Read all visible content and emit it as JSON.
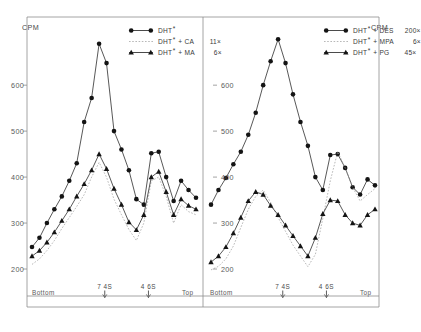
{
  "figure": {
    "axis_unit_label": "CPM",
    "x_axis": {
      "left_label": "Bottom",
      "right_label": "Top",
      "markers": [
        {
          "label": "7 4S",
          "position_fraction": 0.445
        },
        {
          "label": "4 6S",
          "position_fraction": 0.705
        }
      ]
    },
    "y_axis": {
      "ticks": [
        600,
        500,
        400,
        300,
        200
      ],
      "min": 150,
      "max": 720
    }
  },
  "chart_data": [
    {
      "type": "line",
      "title": "Left panel",
      "panel": "left",
      "xlabel": "Sedimentation (Bottom to Top)",
      "ylabel": "CPM",
      "ylim": [
        150,
        720
      ],
      "grid": false,
      "legend_position": "top-right",
      "x_markers": [
        "7 4S",
        "4 6S"
      ],
      "x_axis_endpoints": [
        "Bottom",
        "Top"
      ],
      "series": [
        {
          "name": "DHT*",
          "label_base": "DHT",
          "label_sup": "*",
          "label_competitor": "",
          "label_factor": "",
          "marker": "circle",
          "line": "solid",
          "values": [
            248,
            268,
            300,
            330,
            358,
            392,
            430,
            520,
            572,
            690,
            648,
            500,
            460,
            415,
            352,
            340,
            452,
            455,
            400,
            348,
            392,
            372,
            355
          ]
        },
        {
          "name": "DHT* + CA 11x",
          "label_base": "DHT",
          "label_sup": "*",
          "label_competitor": "+ CA",
          "label_factor": "11×",
          "marker": "none",
          "line": "dotted",
          "values": [
            210,
            222,
            240,
            262,
            288,
            312,
            336,
            362,
            400,
            432,
            400,
            352,
            318,
            286,
            262,
            300,
            392,
            400,
            358,
            300,
            340,
            325,
            318
          ]
        },
        {
          "name": "DHT* + MA 6x",
          "label_base": "DHT",
          "label_sup": "*",
          "label_competitor": "+ MA",
          "label_factor": "6×",
          "marker": "triangle",
          "line": "solid",
          "values": [
            228,
            240,
            258,
            280,
            305,
            330,
            358,
            385,
            415,
            450,
            418,
            375,
            340,
            302,
            285,
            318,
            400,
            412,
            368,
            318,
            352,
            338,
            330
          ]
        }
      ]
    },
    {
      "type": "line",
      "title": "Right panel",
      "panel": "right",
      "xlabel": "Sedimentation (Bottom to Top)",
      "ylabel": "CPM",
      "ylim": [
        150,
        720
      ],
      "grid": false,
      "legend_position": "top-right",
      "x_markers": [
        "7 4S",
        "4 6S"
      ],
      "x_axis_endpoints": [
        "Bottom",
        "Top"
      ],
      "series": [
        {
          "name": "DHT* + DES 200x",
          "label_base": "DHT",
          "label_sup": "*",
          "label_competitor": "+ DES",
          "label_factor": "200×",
          "marker": "circle",
          "line": "solid",
          "values": [
            340,
            372,
            398,
            428,
            455,
            492,
            540,
            600,
            652,
            700,
            648,
            580,
            520,
            468,
            400,
            372,
            448,
            450,
            420,
            378,
            362,
            395,
            382
          ]
        },
        {
          "name": "DHT* + MPA 6x",
          "label_base": "DHT",
          "label_sup": "*",
          "label_competitor": "+ MPA",
          "label_factor": "6×",
          "marker": "none",
          "line": "dotted",
          "values": [
            198,
            206,
            222,
            250,
            290,
            330,
            358,
            372,
            345,
            312,
            282,
            252,
            228,
            205,
            232,
            310,
            392,
            455,
            420,
            378,
            348,
            362,
            375
          ]
        },
        {
          "name": "DHT* + PG 45x",
          "label_base": "DHT",
          "label_sup": "*",
          "label_competitor": "+ PG",
          "label_factor": "45×",
          "marker": "triangle",
          "line": "solid",
          "values": [
            215,
            228,
            248,
            278,
            312,
            348,
            368,
            362,
            338,
            318,
            295,
            272,
            250,
            228,
            268,
            320,
            350,
            348,
            318,
            300,
            295,
            318,
            330
          ]
        }
      ]
    }
  ]
}
